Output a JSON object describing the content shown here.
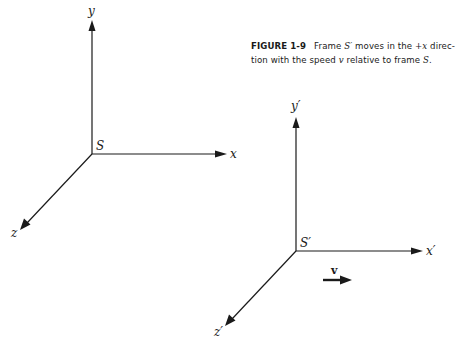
{
  "caption": {
    "figure_number": "FIGURE 1-9",
    "line1_pre": "Frame ",
    "line1_frame": "S′",
    "line1_mid": " moves in the ",
    "line1_dir": "+x",
    "line1_post": " direc-",
    "line2_pre": "tion with the speed ",
    "line2_speed": "v",
    "line2_mid": " relative to frame ",
    "line2_frame": "S",
    "line2_post": "."
  },
  "frame_s": {
    "origin_label": "S",
    "x_label": "x",
    "y_label": "y",
    "z_label": "z"
  },
  "frame_s_prime": {
    "origin_label": "S′",
    "x_label": "x′",
    "y_label": "y′",
    "z_label": "z′"
  },
  "velocity": {
    "label": "v"
  }
}
